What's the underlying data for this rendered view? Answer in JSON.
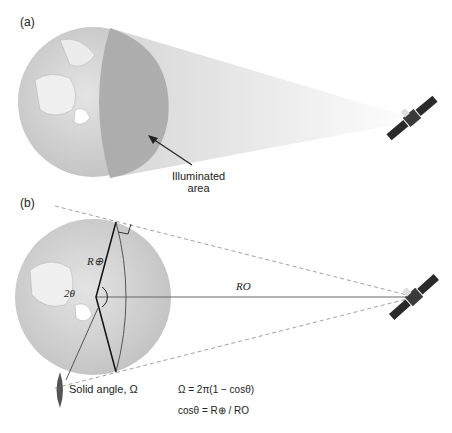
{
  "figure": {
    "panel_a": {
      "label": "(a)",
      "annotation_line1": "Illuminated",
      "annotation_line2": "area"
    },
    "panel_b": {
      "label": "(b)",
      "earth_radius_label": "R⊕",
      "angle_label": "2θ",
      "orbit_radius_label": "RO",
      "solid_angle_label": "Solid angle, Ω",
      "equation_1": "Ω = 2π(1 − cosθ)",
      "equation_2": "cosθ = R⊕ / RO"
    },
    "colors": {
      "globe": "#c8c8c8",
      "illuminated": "#9a9a9a",
      "cone": "#e2e2e2",
      "dashed_line": "#8a8a8a",
      "satellite": "#2a2a2a"
    }
  }
}
